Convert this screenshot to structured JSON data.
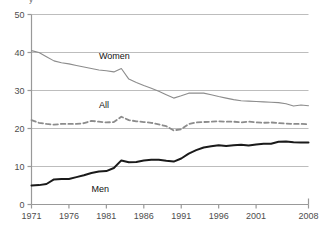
{
  "chart_data": {
    "type": "line",
    "title": "",
    "subtitle": "",
    "xlabel": "",
    "ylabel": "",
    "xlim": [
      1971,
      2008
    ],
    "ylim": [
      0,
      50
    ],
    "grid": true,
    "grid_axis": "y",
    "legend_position": "inline-labels",
    "ytick_labels": [
      "0",
      "10",
      "20",
      "30",
      "40",
      "50"
    ],
    "ytick_values": [
      0,
      10,
      20,
      30,
      40,
      50
    ],
    "xtick_labels": [
      "1971",
      "1976",
      "1981",
      "1986",
      "1991",
      "1996",
      "2001",
      "2008"
    ],
    "xtick_values": [
      1971,
      1976,
      1981,
      1986,
      1991,
      1996,
      2001,
      2008
    ],
    "x": [
      1971,
      1972,
      1973,
      1974,
      1975,
      1976,
      1977,
      1978,
      1979,
      1980,
      1981,
      1982,
      1983,
      1984,
      1985,
      1986,
      1987,
      1988,
      1989,
      1990,
      1991,
      1992,
      1993,
      1994,
      1995,
      1996,
      1997,
      1998,
      1999,
      2000,
      2001,
      2002,
      2003,
      2004,
      2005,
      2006,
      2007,
      2008
    ],
    "series": [
      {
        "name": "Women",
        "style": "solid",
        "color": "#8c8c8c",
        "width": 1.1,
        "label_x": 1980,
        "label_y": 38.2,
        "values": [
          40.5,
          40.0,
          38.9,
          37.8,
          37.3,
          37.0,
          36.6,
          36.2,
          35.8,
          35.4,
          35.2,
          34.9,
          35.8,
          33.0,
          32.1,
          31.3,
          30.6,
          29.8,
          28.9,
          28.0,
          28.6,
          29.3,
          29.3,
          29.3,
          28.9,
          28.4,
          28.0,
          27.6,
          27.3,
          27.2,
          27.1,
          27.0,
          26.9,
          26.8,
          26.5,
          25.9,
          26.2,
          26.0
        ]
      },
      {
        "name": "All",
        "style": "dashed",
        "color": "#8c8c8c",
        "width": 1.8,
        "label_x": 1980,
        "label_y": 25.3,
        "values": [
          22.2,
          21.5,
          21.2,
          21.0,
          21.2,
          21.2,
          21.2,
          21.4,
          22.0,
          21.8,
          21.6,
          21.7,
          23.1,
          22.2,
          21.9,
          21.7,
          21.5,
          21.1,
          20.6,
          19.5,
          19.8,
          21.2,
          21.6,
          21.7,
          21.8,
          21.9,
          21.8,
          21.8,
          21.6,
          21.8,
          21.6,
          21.5,
          21.6,
          21.4,
          21.3,
          21.2,
          21.2,
          21.1
        ]
      },
      {
        "name": "Men",
        "style": "solid",
        "color": "#1a1a1a",
        "width": 2.0,
        "label_x": 1979,
        "label_y": 3.4,
        "values": [
          5.0,
          5.1,
          5.4,
          6.6,
          6.7,
          6.7,
          7.2,
          7.7,
          8.3,
          8.7,
          8.8,
          9.6,
          11.6,
          11.1,
          11.2,
          11.6,
          11.8,
          11.8,
          11.5,
          11.3,
          12.1,
          13.4,
          14.3,
          15.0,
          15.3,
          15.6,
          15.4,
          15.6,
          15.7,
          15.5,
          15.8,
          16.0,
          16.0,
          16.5,
          16.6,
          16.4,
          16.3,
          16.3
        ]
      }
    ]
  },
  "axes": {
    "axis_color": "#999999",
    "grid_color": "#bdbdbd"
  },
  "top_fragment": "y"
}
